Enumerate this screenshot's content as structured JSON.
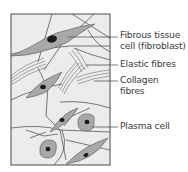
{
  "diagram": {
    "labels": [
      {
        "id": "fibroblast",
        "line1": "Fibrous tissue",
        "line2": "cell (fibroblast)",
        "pointer_y": 37
      },
      {
        "id": "elastic",
        "line1": "Elastic fibres",
        "line2": "",
        "pointer_y": 65
      },
      {
        "id": "collagen",
        "line1": "Collagen",
        "line2": "fibres",
        "pointer_y": 81
      },
      {
        "id": "plasma",
        "line1": "Plasma cell",
        "line2": "",
        "pointer_y": 127
      }
    ],
    "colors": {
      "background": "#ececec",
      "border": "#4a4a4a",
      "cell_fill": "#a8a8a8",
      "nucleus": "#1a1a1a",
      "fibre": "#444444",
      "text": "#3a3a3a"
    }
  }
}
